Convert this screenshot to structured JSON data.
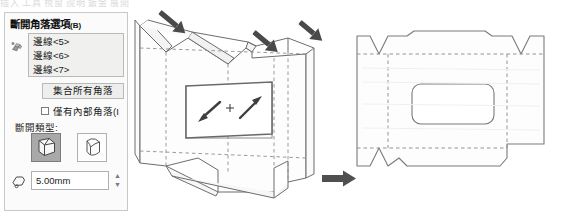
{
  "top_strip": {
    "clipped_text": "插入 工具 視窗 說明     鈑金     展開"
  },
  "panel": {
    "title": "斷開角落選項",
    "title_suffix": "(B)",
    "edge_icon": "edge-select-icon",
    "selection_list": [
      {
        "label": "邊線<5>"
      },
      {
        "label": "邊線<6>"
      },
      {
        "label": "邊線<7>"
      }
    ],
    "collect_button": "集合所有角落",
    "internal_only_checkbox": {
      "label": "僅有內部角落(I",
      "checked": false
    },
    "break_type_label": "斷開類型:",
    "break_types": [
      {
        "name": "chamfer-icon",
        "selected": true
      },
      {
        "name": "fillet-icon",
        "selected": false
      }
    ],
    "value_field": {
      "icon": "distance-icon",
      "value": "5.00mm",
      "spinner_up": "▲",
      "spinner_down": "▼"
    }
  },
  "graphics": {
    "view_3d_name": "sheet-metal-folded-model",
    "flat_pattern_name": "sheet-metal-flat-pattern",
    "transition_arrow": "right-arrow-icon",
    "callout_arrows": 3,
    "center_manipulator": "+"
  },
  "colors": {
    "panel_bg": "#fbfbfb",
    "panel_border": "#c8c8c8",
    "listbox_bg": "#f0f0ef",
    "button_bg": "#eeeeec",
    "selected_btn_bg": "#a9a9a9",
    "model_line": "#6d6d6d",
    "dashed_line": "#8e8e8e",
    "arrow_dark": "#4a4a4a",
    "flat_fill": "#fdfdfd"
  }
}
